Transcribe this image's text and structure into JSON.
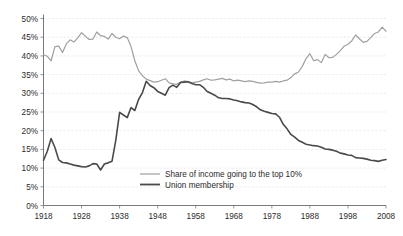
{
  "chart_data": {
    "type": "line",
    "title": "",
    "subtitle": "",
    "xlabel": "",
    "ylabel": "",
    "xlim": [
      1918,
      2008
    ],
    "ylim": [
      0,
      50
    ],
    "grid": true,
    "legend_position": "inside-bottom-center",
    "y_tick_labels": [
      "0%",
      "5%",
      "10%",
      "15%",
      "20%",
      "25%",
      "30%",
      "35%",
      "40%",
      "45%",
      "50%"
    ],
    "y_tick_values": [
      0,
      5,
      10,
      15,
      20,
      25,
      30,
      35,
      40,
      45,
      50
    ],
    "x_tick_labels": [
      "1918",
      "1928",
      "1938",
      "1948",
      "1958",
      "1968",
      "1978",
      "1988",
      "1998",
      "2008"
    ],
    "x_tick_values": [
      1918,
      1928,
      1938,
      1948,
      1958,
      1968,
      1978,
      1988,
      1998,
      2008
    ],
    "x": [
      1918,
      1919,
      1920,
      1921,
      1922,
      1923,
      1924,
      1925,
      1926,
      1927,
      1928,
      1929,
      1930,
      1931,
      1932,
      1933,
      1934,
      1935,
      1936,
      1937,
      1938,
      1939,
      1940,
      1941,
      1942,
      1943,
      1944,
      1945,
      1946,
      1947,
      1948,
      1949,
      1950,
      1951,
      1952,
      1953,
      1954,
      1955,
      1956,
      1957,
      1958,
      1959,
      1960,
      1961,
      1962,
      1963,
      1964,
      1965,
      1966,
      1967,
      1968,
      1969,
      1970,
      1971,
      1972,
      1973,
      1974,
      1975,
      1976,
      1977,
      1978,
      1979,
      1980,
      1981,
      1982,
      1983,
      1984,
      1985,
      1986,
      1987,
      1988,
      1989,
      1990,
      1991,
      1992,
      1993,
      1994,
      1995,
      1996,
      1997,
      1998,
      1999,
      2000,
      2001,
      2002,
      2003,
      2004,
      2005,
      2006,
      2007,
      2008
    ],
    "series": [
      {
        "name": "Share of income going to the top 10%",
        "color": "#a0a0a0",
        "width": 1.2,
        "values": [
          40.3,
          39.9,
          38.7,
          42.5,
          42.6,
          40.9,
          43.2,
          44.3,
          43.7,
          44.8,
          46.2,
          45.3,
          44.4,
          44.5,
          46.4,
          45.4,
          45.2,
          44.5,
          46.0,
          45.0,
          44.6,
          45.3,
          44.9,
          42.5,
          38.7,
          36.0,
          34.7,
          33.8,
          33.4,
          33.0,
          33.1,
          33.5,
          33.9,
          32.8,
          32.5,
          32.4,
          33.0,
          33.3,
          33.1,
          32.8,
          33.0,
          33.2,
          33.6,
          33.9,
          33.5,
          33.6,
          33.8,
          34.0,
          33.6,
          33.8,
          33.3,
          33.5,
          33.3,
          33.1,
          33.3,
          33.2,
          32.9,
          32.7,
          32.8,
          33.0,
          33.0,
          33.2,
          33.0,
          33.3,
          33.5,
          34.2,
          35.2,
          35.7,
          37.2,
          39.3,
          40.6,
          38.7,
          39.0,
          38.2,
          40.4,
          39.5,
          39.6,
          40.4,
          41.4,
          42.6,
          43.1,
          44.0,
          45.6,
          44.6,
          43.6,
          43.9,
          44.9,
          46.0,
          46.4,
          47.7,
          46.6
        ]
      },
      {
        "name": "Union membership",
        "color": "#4a4a4a",
        "width": 1.6,
        "values": [
          12.1,
          14.5,
          17.9,
          15.5,
          12.2,
          11.5,
          11.4,
          11.1,
          10.8,
          10.6,
          10.4,
          10.3,
          10.6,
          11.2,
          11.1,
          9.5,
          11.1,
          11.4,
          11.8,
          17.5,
          24.9,
          24.2,
          23.5,
          26.2,
          25.4,
          28.4,
          30.2,
          33.2,
          32.1,
          31.5,
          30.5,
          30.0,
          29.5,
          31.5,
          32.2,
          31.6,
          32.9,
          33.0,
          33.1,
          32.6,
          32.3,
          32.3,
          31.6,
          30.5,
          30.0,
          29.5,
          28.8,
          28.6,
          28.6,
          28.5,
          28.2,
          28.0,
          27.7,
          27.5,
          27.4,
          27.0,
          26.4,
          25.6,
          25.2,
          24.9,
          24.6,
          24.5,
          23.6,
          21.7,
          20.5,
          19.0,
          18.3,
          17.4,
          16.9,
          16.4,
          16.2,
          16.0,
          15.9,
          15.6,
          15.1,
          15.0,
          14.8,
          14.5,
          14.0,
          13.8,
          13.5,
          13.4,
          12.8,
          12.7,
          12.6,
          12.4,
          12.1,
          12.0,
          11.8,
          12.1,
          12.3
        ]
      }
    ]
  },
  "legend": {
    "items": [
      {
        "label": "Share of income going to the top 10%",
        "color": "#a0a0a0",
        "width": 1.2
      },
      {
        "label": "Union membership",
        "color": "#4a4a4a",
        "width": 1.8
      }
    ]
  },
  "colors": {
    "background": "#ffffff",
    "axis": "#7a7a7a",
    "grid": "#d8d8d8",
    "text": "#2b2b2b",
    "income_series": "#a0a0a0",
    "union_series": "#4a4a4a"
  }
}
